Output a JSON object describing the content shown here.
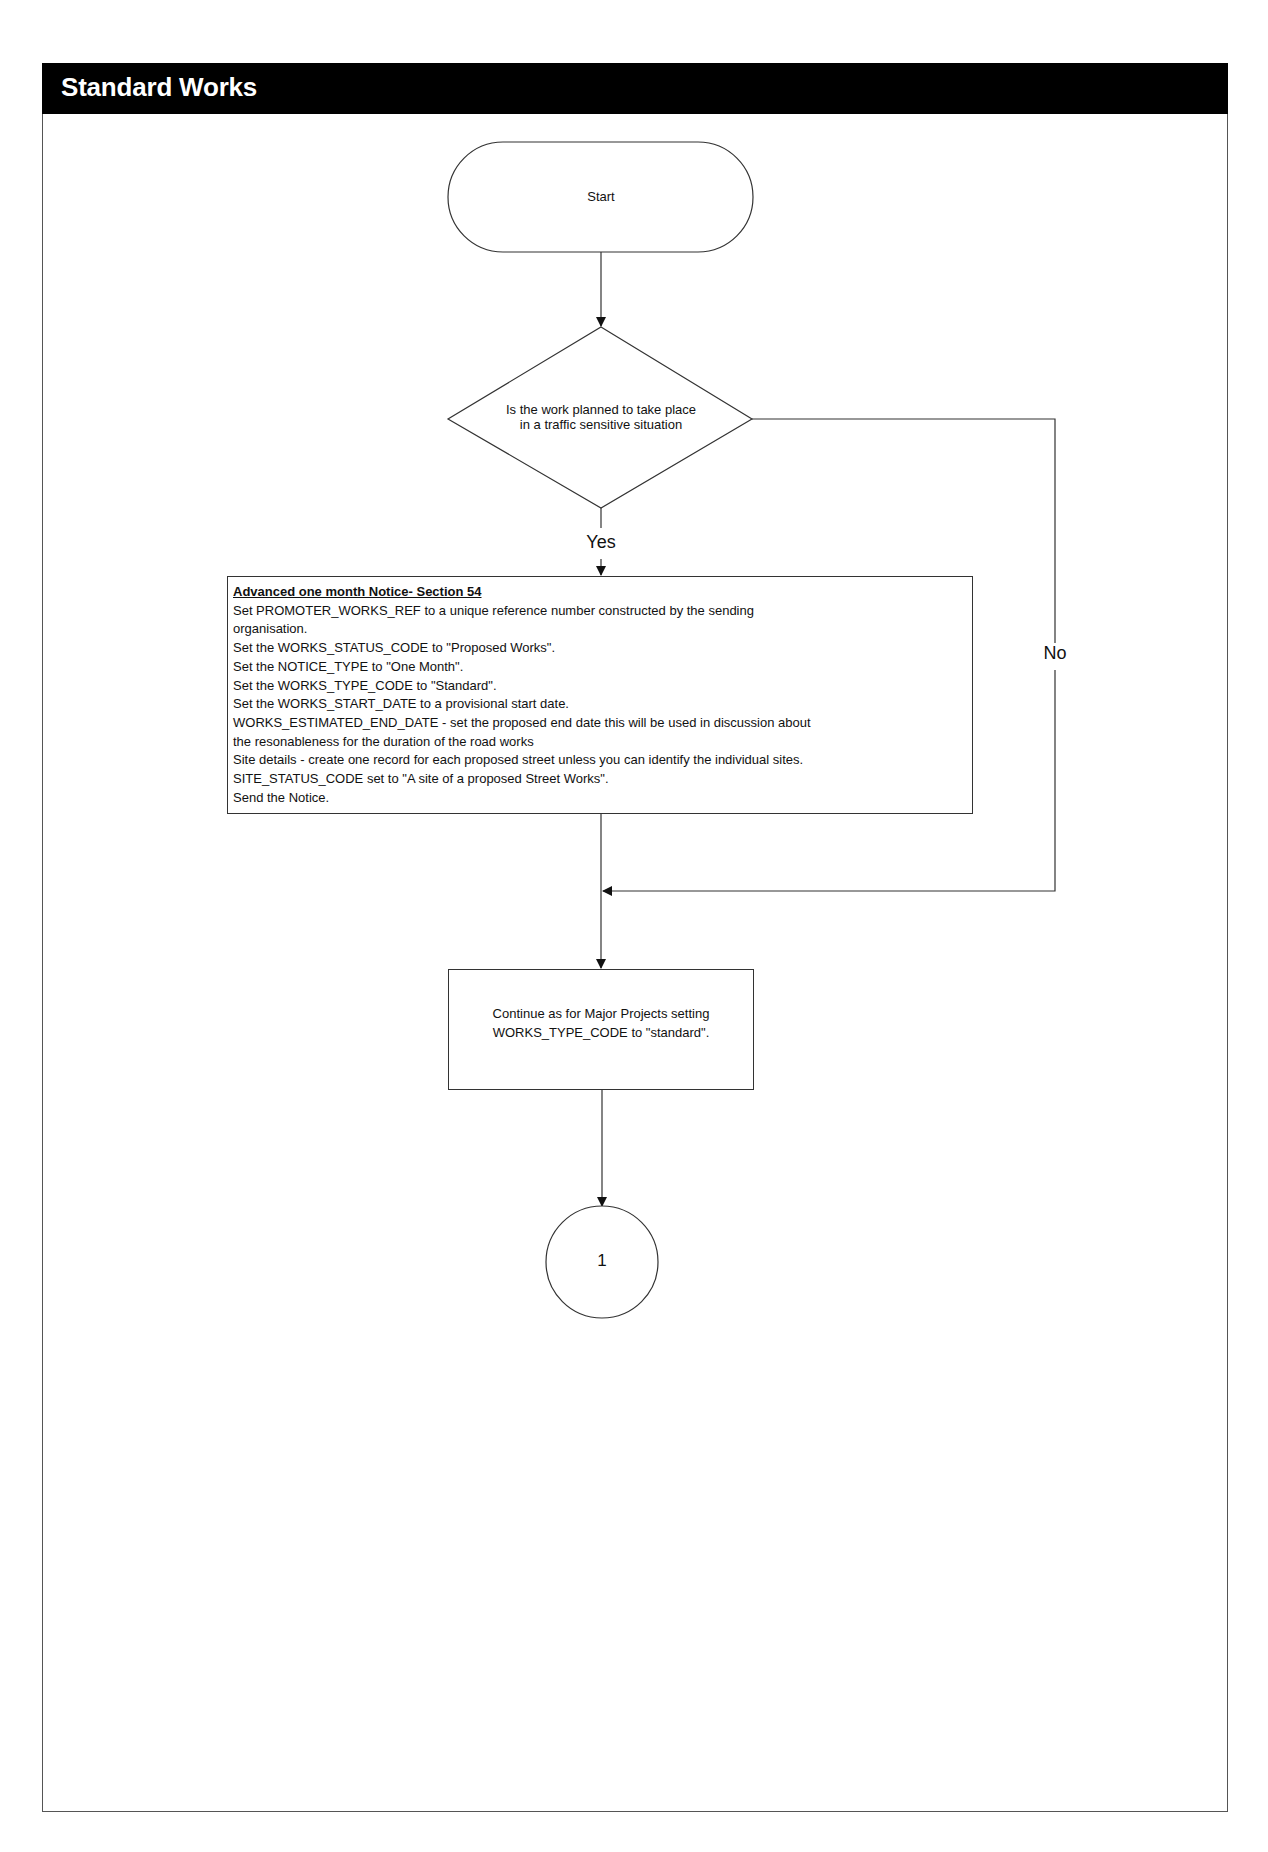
{
  "header": {
    "title": "Standard Works"
  },
  "flowchart": {
    "start": {
      "label": "Start"
    },
    "decision": {
      "lines": [
        "Is the work planned to take place",
        "in a traffic sensitive situation"
      ]
    },
    "yes_label": "Yes",
    "no_label": "No",
    "process_notice": {
      "title": "Advanced one month Notice- Section 54",
      "lines": [
        "Set PROMOTER_WORKS_REF to a unique reference number constructed by the sending",
        "organisation.",
        "Set the WORKS_STATUS_CODE to \"Proposed Works\".",
        "Set the NOTICE_TYPE to \"One Month\".",
        "Set the WORKS_TYPE_CODE to \"Standard\".",
        "Set the WORKS_START_DATE to a provisional start date.",
        "WORKS_ESTIMATED_END_DATE - set the proposed end date this will be used in discussion about",
        "the resonableness for the duration of the road works",
        "Site details - create one record for each proposed street unless you can identify the individual sites.",
        "SITE_STATUS_CODE set to \"A site of a proposed Street Works\".",
        "Send the Notice."
      ]
    },
    "process_continue": {
      "lines": [
        "Continue as for Major Projects setting",
        "WORKS_TYPE_CODE to \"standard\"."
      ]
    },
    "connector": {
      "label": "1"
    }
  },
  "colors": {
    "header_bg": "#000000",
    "header_text": "#ffffff",
    "line": "#333333"
  }
}
